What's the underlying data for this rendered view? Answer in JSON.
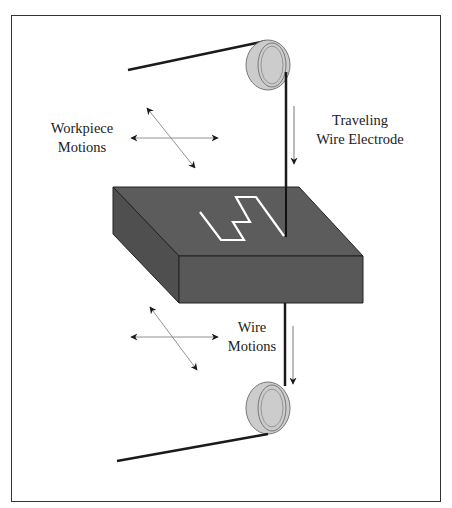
{
  "diagram": {
    "labels": {
      "workpiece_motions": [
        "Workpiece",
        "Motions"
      ],
      "traveling_wire": [
        "Traveling",
        "Wire Electrode"
      ],
      "wire_motions": [
        "Wire",
        "Motions"
      ]
    },
    "colors": {
      "workpiece_top": "#5a5a5a",
      "workpiece_front": "#555555",
      "workpiece_side": "#4e4e4e",
      "spool": "#cccccc",
      "wire": "#1a1a1a",
      "cut_path": "#ffffff",
      "frame": "#333333"
    }
  }
}
